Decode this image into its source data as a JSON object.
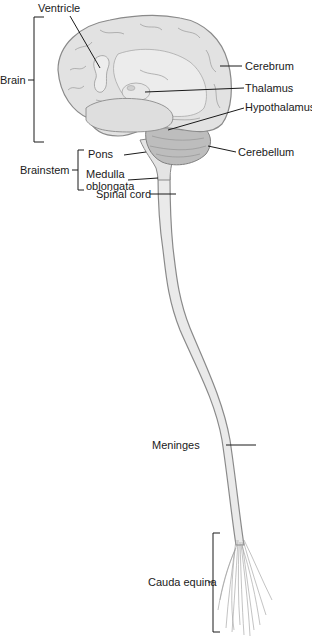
{
  "diagram": {
    "colors": {
      "tissue_fill": "#e2e2e2",
      "tissue_light": "#ececec",
      "outline": "#8a8a8a",
      "cerebellum_fill": "#b9b9b9",
      "leader_line": "#1a1a1a",
      "background": "#ffffff"
    },
    "labels": {
      "ventricle": "Ventricle",
      "brain": "Brain",
      "cerebrum": "Cerebrum",
      "thalamus": "Thalamus",
      "hypothalamus": "Hypothalamus",
      "cerebellum": "Cerebellum",
      "pons": "Pons",
      "brainstem": "Brainstem",
      "medulla_line1": "Medulla",
      "medulla_line2": "oblongata",
      "spinal_cord": "Spinal cord",
      "meninges": "Meninges",
      "cauda_equina": "Cauda equina"
    }
  }
}
